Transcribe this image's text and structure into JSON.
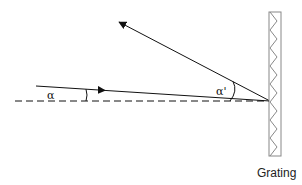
{
  "diagram": {
    "labels": {
      "incident_angle": "α",
      "diffracted_angle": "α'",
      "grating": "Grating"
    },
    "colors": {
      "line": "#111111",
      "grating_outline": "#888888",
      "grating_zigzag": "#888888",
      "background": "#ffffff"
    },
    "elements": {
      "normal_line": {
        "style": "dashed",
        "from": [
          15,
          101
        ],
        "to": [
          270,
          101
        ]
      },
      "incident_ray": {
        "from": [
          36,
          86
        ],
        "to": [
          270,
          101
        ],
        "arrow_at": [
          105,
          91
        ]
      },
      "diffracted_ray": {
        "from": [
          270,
          101
        ],
        "to": [
          118,
          21
        ],
        "arrow_at": [
          118,
          21
        ]
      },
      "grating": {
        "x": 269,
        "y": 12,
        "width": 12,
        "height": 144
      }
    }
  }
}
